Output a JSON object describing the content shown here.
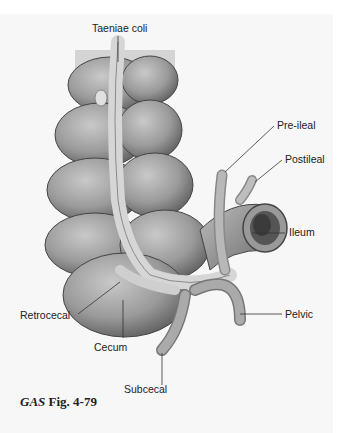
{
  "figure": {
    "caption_prefix": "GAS",
    "caption_suffix": "Fig. 4-79"
  },
  "labels": {
    "taeniae_coli": "Taeniae coli",
    "pre_ileal": "Pre-ileal",
    "postileal": "Postileal",
    "ileum": "Ileum",
    "pelvic": "Pelvic",
    "retrocecal": "Retrocecal",
    "cecum": "Cecum",
    "subcecal": "Subcecal"
  },
  "colors": {
    "background": "#f7f7f7",
    "organ_fill": "#a9a9a9",
    "organ_shadow": "#6e6e6e",
    "taenia": "#d2d2d2",
    "leader_lines": "#333333"
  }
}
